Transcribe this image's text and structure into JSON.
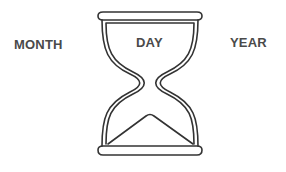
{
  "labels": {
    "left": "MONTH",
    "center": "DAY",
    "right": "YEAR"
  },
  "icon": {
    "name": "hourglass-icon",
    "stroke_color": "#333333"
  },
  "colors": {
    "background": "#ffffff",
    "text": "#4a4a4a"
  }
}
